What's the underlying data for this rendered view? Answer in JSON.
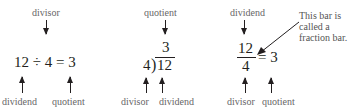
{
  "panel1": {
    "top_label": "divisor",
    "equation": "12 ÷ 4 = 3",
    "bottom_left_label": "dividend",
    "bottom_right_label": "quotient"
  },
  "panel2": {
    "top_label": "quotient",
    "quotient": "3",
    "divisor": "4",
    "dividend": "12",
    "bottom_left_label": "divisor",
    "bottom_right_label": "dividend"
  },
  "panel3": {
    "top_label": "dividend",
    "numerator": "12",
    "denominator": "4",
    "equals": "= 3",
    "note_lines": [
      "This bar is",
      "called a",
      "fraction bar."
    ],
    "bottom_left_label": "divisor",
    "bottom_right_label": "quotient"
  }
}
